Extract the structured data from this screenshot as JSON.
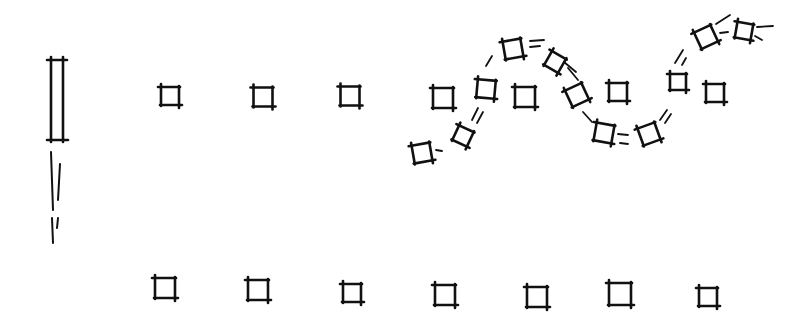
{
  "colors": {
    "ink": "#111111",
    "background": "#ffffff"
  },
  "pillar": {
    "x": 48,
    "y": 57,
    "w": 18,
    "h": 85
  },
  "pillar_dashes": [
    {
      "x1": 51,
      "y1": 152,
      "x2": 53,
      "y2": 210
    },
    {
      "x1": 60,
      "y1": 164,
      "x2": 58,
      "y2": 200
    },
    {
      "x1": 52,
      "y1": 218,
      "x2": 53,
      "y2": 243
    },
    {
      "x1": 58,
      "y1": 218,
      "x2": 57,
      "y2": 228
    }
  ],
  "top_row": [
    {
      "cx": 170,
      "cy": 96,
      "s": 18,
      "r": 0
    },
    {
      "cx": 263,
      "cy": 97,
      "s": 19,
      "r": 0
    },
    {
      "cx": 350,
      "cy": 96,
      "s": 19,
      "r": 0
    },
    {
      "cx": 443,
      "cy": 98,
      "s": 20,
      "r": 0
    },
    {
      "cx": 525,
      "cy": 97,
      "s": 20,
      "r": 0
    },
    {
      "cx": 618,
      "cy": 92,
      "s": 18,
      "r": 0
    },
    {
      "cx": 715,
      "cy": 93,
      "s": 18,
      "r": 0
    }
  ],
  "wave": [
    {
      "cx": 422,
      "cy": 153,
      "s": 18,
      "r": -10
    },
    {
      "cx": 463,
      "cy": 136,
      "s": 16,
      "r": 25
    },
    {
      "cx": 486,
      "cy": 89,
      "s": 18,
      "r": 5
    },
    {
      "cx": 513,
      "cy": 49,
      "s": 18,
      "r": -10
    },
    {
      "cx": 555,
      "cy": 62,
      "s": 16,
      "r": 30
    },
    {
      "cx": 577,
      "cy": 95,
      "s": 18,
      "r": -25
    },
    {
      "cx": 604,
      "cy": 133,
      "s": 18,
      "r": 10
    },
    {
      "cx": 649,
      "cy": 134,
      "s": 18,
      "r": -20
    },
    {
      "cx": 678,
      "cy": 82,
      "s": 16,
      "r": 0
    },
    {
      "cx": 706,
      "cy": 37,
      "s": 18,
      "r": -25
    },
    {
      "cx": 744,
      "cy": 31,
      "s": 16,
      "r": 10
    }
  ],
  "wave_dashes": [
    {
      "x1": 436,
      "y1": 150,
      "x2": 442,
      "y2": 151
    },
    {
      "x1": 472,
      "y1": 120,
      "x2": 478,
      "y2": 108
    },
    {
      "x1": 477,
      "y1": 123,
      "x2": 483,
      "y2": 112
    },
    {
      "x1": 486,
      "y1": 66,
      "x2": 492,
      "y2": 56
    },
    {
      "x1": 530,
      "y1": 41,
      "x2": 544,
      "y2": 40
    },
    {
      "x1": 530,
      "y1": 47,
      "x2": 540,
      "y2": 46
    },
    {
      "x1": 564,
      "y1": 62,
      "x2": 576,
      "y2": 72
    },
    {
      "x1": 568,
      "y1": 68,
      "x2": 578,
      "y2": 80
    },
    {
      "x1": 583,
      "y1": 112,
      "x2": 592,
      "y2": 122
    },
    {
      "x1": 618,
      "y1": 134,
      "x2": 628,
      "y2": 135
    },
    {
      "x1": 620,
      "y1": 143,
      "x2": 628,
      "y2": 144
    },
    {
      "x1": 660,
      "y1": 120,
      "x2": 667,
      "y2": 110
    },
    {
      "x1": 665,
      "y1": 123,
      "x2": 671,
      "y2": 114
    },
    {
      "x1": 675,
      "y1": 63,
      "x2": 683,
      "y2": 50
    },
    {
      "x1": 682,
      "y1": 65,
      "x2": 686,
      "y2": 58
    },
    {
      "x1": 716,
      "y1": 24,
      "x2": 730,
      "y2": 15
    },
    {
      "x1": 720,
      "y1": 33,
      "x2": 728,
      "y2": 32
    },
    {
      "x1": 757,
      "y1": 27,
      "x2": 773,
      "y2": 26
    },
    {
      "x1": 755,
      "y1": 36,
      "x2": 762,
      "y2": 40
    }
  ],
  "bottom_row": [
    {
      "cx": 165,
      "cy": 288,
      "s": 20,
      "r": 0
    },
    {
      "cx": 258,
      "cy": 290,
      "s": 20,
      "r": 0
    },
    {
      "cx": 352,
      "cy": 293,
      "s": 18,
      "r": 0
    },
    {
      "cx": 445,
      "cy": 295,
      "s": 20,
      "r": 0
    },
    {
      "cx": 537,
      "cy": 297,
      "s": 20,
      "r": 0
    },
    {
      "cx": 620,
      "cy": 294,
      "s": 22,
      "r": 0
    },
    {
      "cx": 708,
      "cy": 297,
      "s": 18,
      "r": 0
    }
  ]
}
